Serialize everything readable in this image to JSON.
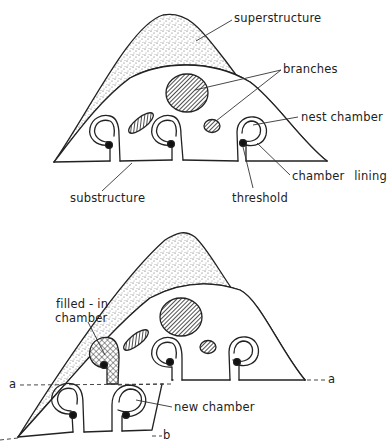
{
  "figure": {
    "top_panel": {
      "labels": {
        "superstructure": "superstructure",
        "branches": "branches",
        "nest_chamber": "nest chamber",
        "chamber_lining": "chamber lining",
        "substructure": "substructure",
        "threshold": "threshold"
      }
    },
    "bottom_panel": {
      "labels": {
        "filled_in_chamber_line1": "filled - in",
        "filled_in_chamber_line2": "chamber",
        "new_chamber": "new chamber",
        "level_a_left": "a",
        "level_a_right": "a",
        "level_b": "b"
      }
    },
    "colors": {
      "ink": "#222222",
      "background": "#ffffff",
      "stipple": "#555555"
    }
  }
}
